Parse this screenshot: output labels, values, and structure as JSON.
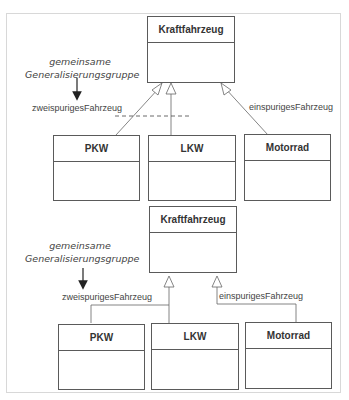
{
  "diagrams": [
    {
      "variant": "separate-arrows",
      "superclass": "Kraftfahrzeug",
      "subclasses": [
        "PKW",
        "LKW",
        "Motorrad"
      ],
      "note": {
        "line1": "gemeinsame",
        "line2": "Generalisierungsgruppe"
      },
      "labels": {
        "left": "zweispurigesFahrzeug",
        "right": "einspurigesFahrzeug"
      }
    },
    {
      "variant": "shared-arrows",
      "superclass": "Kraftfahrzeug",
      "subclasses": [
        "PKW",
        "LKW",
        "Motorrad"
      ],
      "note": {
        "line1": "gemeinsame",
        "line2": "Generalisierungsgruppe"
      },
      "labels": {
        "left": "zweispurigesFahrzeug",
        "right": "einspurigesFahrzeug"
      }
    }
  ]
}
